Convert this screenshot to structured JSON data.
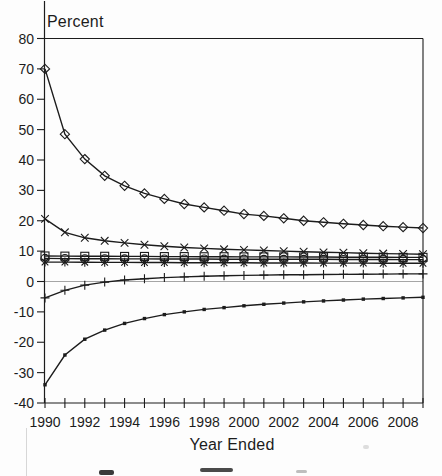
{
  "colors": {
    "ink": "#1c1c1c",
    "zero_line": "#9b9b9b"
  },
  "chart_data": {
    "type": "line",
    "title": "",
    "ylabel": "Percent",
    "xlabel": "Year Ended",
    "ylim": [
      -40,
      80
    ],
    "xlim": [
      1990,
      2009
    ],
    "grid": "zero-line-only",
    "legend_position": "none",
    "y_ticks": [
      80,
      70,
      60,
      50,
      40,
      30,
      20,
      10,
      0,
      -10,
      -20,
      -30,
      -40
    ],
    "x_tick_labels": [
      "1990",
      "1992",
      "1994",
      "1996",
      "1998",
      "2000",
      "2002",
      "2004",
      "2006",
      "2008"
    ],
    "x": [
      1990,
      1991,
      1992,
      1993,
      1994,
      1995,
      1996,
      1997,
      1998,
      1999,
      2000,
      2001,
      2002,
      2003,
      2004,
      2005,
      2006,
      2007,
      2008,
      2009
    ],
    "series": [
      {
        "name": "diamond-marker-series",
        "marker": "diamond",
        "values": [
          70,
          48.5,
          40.3,
          34.8,
          31.5,
          29,
          27.2,
          25.5,
          24.4,
          23.3,
          22.2,
          21.6,
          20.8,
          20,
          19.5,
          19,
          18.6,
          18.2,
          17.9,
          17.6
        ]
      },
      {
        "name": "x-marker-series",
        "marker": "x",
        "values": [
          20.6,
          16.2,
          14.4,
          13.4,
          12.7,
          12.1,
          11.6,
          11.2,
          10.9,
          10.6,
          10.4,
          10.2,
          10,
          9.8,
          9.6,
          9.5,
          9.3,
          9.2,
          9.1,
          9
        ]
      },
      {
        "name": "square-marker-series",
        "marker": "square",
        "values": [
          8.4,
          8.35,
          8.3,
          8.3,
          8.25,
          8.25,
          8.2,
          8.2,
          8.15,
          8.15,
          8.1,
          8.1,
          8.1,
          8.05,
          8.05,
          8,
          8,
          8,
          7.95,
          7.95
        ]
      },
      {
        "name": "circle-marker-series",
        "marker": "circle",
        "values": [
          7.6,
          7.55,
          7.5,
          7.5,
          7.45,
          7.45,
          7.4,
          7.4,
          7.4,
          7.35,
          7.35,
          7.3,
          7.3,
          7.3,
          7.3,
          7.25,
          7.25,
          7.25,
          7.2,
          7.2
        ]
      },
      {
        "name": "asterisk-marker-series",
        "marker": "asterisk",
        "values": [
          6.4,
          6.4,
          6.35,
          6.3,
          6.3,
          6.25,
          6.25,
          6.2,
          6.2,
          6.15,
          6.15,
          6.1,
          6.1,
          6.1,
          6.05,
          6.05,
          6.05,
          6,
          6,
          6
        ]
      },
      {
        "name": "plus-marker-series",
        "marker": "plus",
        "values": [
          -5.4,
          -2.9,
          -1.2,
          -0.2,
          0.5,
          0.9,
          1.3,
          1.5,
          1.7,
          1.9,
          2,
          2.1,
          2.2,
          2.25,
          2.3,
          2.35,
          2.4,
          2.45,
          2.5,
          2.5
        ]
      },
      {
        "name": "filled-dot-series",
        "marker": "filled-square-small",
        "values": [
          -34,
          -24.2,
          -19,
          -16,
          -13.8,
          -12.2,
          -10.9,
          -10,
          -9.2,
          -8.6,
          -8,
          -7.5,
          -7.1,
          -6.7,
          -6.4,
          -6.1,
          -5.8,
          -5.6,
          -5.4,
          -5.2
        ]
      }
    ]
  }
}
